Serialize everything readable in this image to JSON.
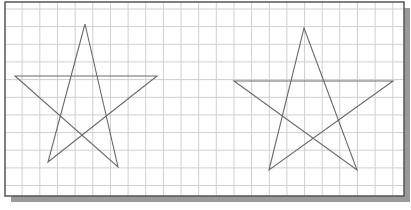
{
  "diagram": {
    "type": "graph-paper-stars",
    "colors": {
      "background": "#ffffff",
      "grid": "#cfcfcf",
      "frame": "#555555",
      "shadow": "#9a9a9a",
      "star_stroke": "#6a6a6a"
    },
    "frame": {
      "x": 5,
      "y": 2,
      "width": 399,
      "height": 194,
      "shadow_offset": 6
    },
    "grid": {
      "origin_x": 4.5,
      "origin_y": 9,
      "spacing": 17.65
    },
    "stars": [
      {
        "name": "left-star",
        "points": [
          [
            85,
            24
          ],
          [
            118,
            167
          ],
          [
            15,
            76
          ],
          [
            157,
            76
          ],
          [
            48,
            162
          ]
        ]
      },
      {
        "name": "right-star",
        "points": [
          [
            304,
            28
          ],
          [
            357,
            170
          ],
          [
            234,
            81
          ],
          [
            393,
            81
          ],
          [
            269,
            170
          ]
        ]
      }
    ]
  }
}
